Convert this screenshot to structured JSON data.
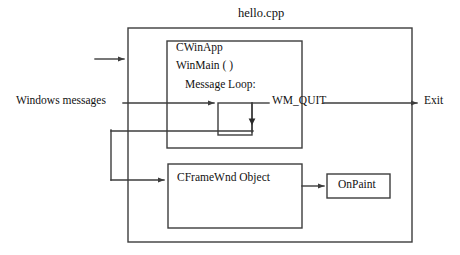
{
  "diagram": {
    "title": "hello.cpp",
    "stroke_color": "#3d3d3d",
    "text_color": "#111111",
    "background": "#ffffff",
    "boxes": {
      "outer": {
        "label": "hello.cpp",
        "x": 128,
        "y": 28,
        "w": 284,
        "h": 214
      },
      "cwinapp": {
        "label": "CWinApp",
        "x": 167,
        "y": 41,
        "w": 135,
        "h": 107
      },
      "message_loop_box": {
        "label": "",
        "x": 218,
        "y": 103,
        "w": 34,
        "h": 32
      },
      "cframewnd": {
        "label": "CFrameWnd Object",
        "x": 168,
        "y": 164,
        "w": 134,
        "h": 64
      },
      "onpaint": {
        "label": "OnPaint",
        "x": 327,
        "y": 174,
        "w": 63,
        "h": 24
      }
    },
    "labels": {
      "cwinapp": "CWinApp",
      "winmain": "WinMain ( )",
      "message_loop": "Message Loop:",
      "wm_quit": "WM_QUIT",
      "windows_messages": "Windows messages",
      "exit": "Exit",
      "cframewnd": "CFrameWnd Object",
      "onpaint": "OnPaint"
    },
    "connectors": [
      {
        "name": "top-entry-arrow",
        "from": [
          95,
          59
        ],
        "to": [
          127,
          59
        ],
        "arrow": "right"
      },
      {
        "name": "windows-messages-to-loop",
        "from": [
          123,
          103
        ],
        "to": [
          216,
          103
        ],
        "arrow": "right"
      },
      {
        "name": "loop-to-wm-quit",
        "from": [
          252,
          103
        ],
        "to": [
          268,
          103
        ],
        "arrow": "none"
      },
      {
        "name": "wm-quit-to-exit",
        "from": [
          325,
          103
        ],
        "to": [
          419,
          103
        ],
        "arrow": "right"
      },
      {
        "name": "loop-feedback-down",
        "from": [
          252,
          103
        ],
        "to": [
          252,
          135
        ],
        "arrow": "down-mid"
      },
      {
        "name": "feedback-left",
        "from": [
          252,
          131
        ],
        "to": [
          111,
          131
        ],
        "arrow": "none"
      },
      {
        "name": "feedback-down-left",
        "from": [
          111,
          131
        ],
        "to": [
          111,
          180
        ],
        "arrow": "none"
      },
      {
        "name": "feedback-to-cframewnd",
        "from": [
          111,
          180
        ],
        "to": [
          166,
          180
        ],
        "arrow": "right"
      },
      {
        "name": "cframewnd-to-onpaint",
        "from": [
          302,
          186
        ],
        "to": [
          325,
          186
        ],
        "arrow": "right"
      }
    ]
  }
}
